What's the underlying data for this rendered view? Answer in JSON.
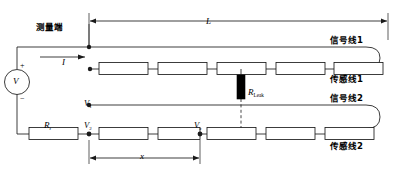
{
  "figure": {
    "type": "circuit-schematic"
  },
  "labels": {
    "measurement_end": "测量端",
    "current": "I",
    "source": "V",
    "plus": "+",
    "minus": "−",
    "rt": "R",
    "rt_sub": "t",
    "v1": "V",
    "v1_sub": "1",
    "v2": "V",
    "v2_sub": "2",
    "vx": "V",
    "vx_sub": "x",
    "rleak": "R",
    "rleak_sub": "Leak",
    "length_L": "L",
    "distance_x": "x",
    "signal_line_1": "信号线1",
    "sense_line_1": "传感线1",
    "signal_line_2": "信号线2",
    "sense_line_2": "传感线2"
  },
  "colors": {
    "stroke": "#000000",
    "background": "#ffffff",
    "resistor_fill": "#ffffff",
    "leak_fill": "#000000"
  },
  "geometry": {
    "dimension_L": {
      "x1": 89,
      "x2": 388,
      "y": 21
    },
    "dimension_x": {
      "x1": 89,
      "x2": 200,
      "y": 158
    },
    "top_resistor_row_y": 69,
    "bottom_resistor_row_y": 134,
    "signal_line_1_y": 47,
    "signal_line_2_y": 105,
    "resistor_count_per_row": 5
  }
}
